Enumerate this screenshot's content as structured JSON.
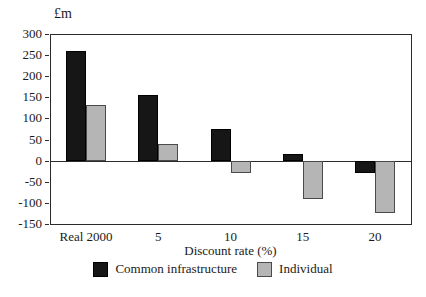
{
  "chart_data": {
    "type": "bar",
    "unit_label": "£m",
    "xlabel": "Discount rate (%)",
    "categories": [
      "Real 2000",
      "5",
      "10",
      "15",
      "20"
    ],
    "series": [
      {
        "name": "Common infrastructure",
        "color": "#161616",
        "border": "#000000",
        "values": [
          260,
          155,
          75,
          15,
          -30
        ]
      },
      {
        "name": "Individual",
        "color": "#b5b5b5",
        "border": "#4a4a4a",
        "values": [
          133,
          40,
          -30,
          -90,
          -125
        ]
      }
    ],
    "ylim": [
      -150,
      300
    ],
    "ytick_step": 50,
    "yticks": [
      300,
      250,
      200,
      150,
      100,
      50,
      0,
      -50,
      -100,
      -150
    ],
    "legend_position": "bottom",
    "grid": "zero-line-only",
    "frame_color": "#2b2b2b",
    "background": "#ffffff"
  }
}
